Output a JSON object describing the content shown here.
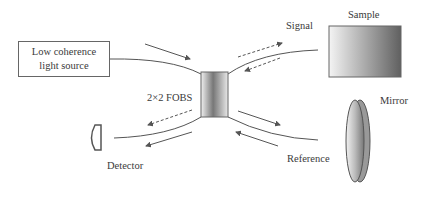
{
  "diagram": {
    "nodes": {
      "source": {
        "line1": "Low coherence",
        "line2": "light source"
      },
      "coupler": {
        "label": "2×2 FOBS"
      },
      "sample": {
        "label": "Sample"
      },
      "mirror": {
        "label": "Mirror"
      },
      "detector": {
        "label": "Detector"
      }
    },
    "arms": {
      "signal": {
        "label": "Signal"
      },
      "reference": {
        "label": "Reference"
      }
    },
    "colors": {
      "line": "#555555",
      "box_border": "#666666",
      "text": "#3a3a3a"
    }
  }
}
